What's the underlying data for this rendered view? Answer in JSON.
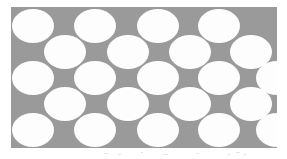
{
  "figure": {
    "name": "circle-packing-diagram",
    "canvas_width": 287,
    "canvas_height": 159,
    "background_color": "#ffffff"
  },
  "panel": {
    "label": "packing-panel",
    "x": 11,
    "y": 7,
    "width": 266,
    "height": 141,
    "fill_color": "#9a9a9a"
  },
  "circles": {
    "fill_color": "#fdfdfd",
    "count": 22,
    "radius_x": 21,
    "radius_y": 17,
    "items": [
      {
        "id": "r1c1",
        "row": 1,
        "cx": 33,
        "cy": 26
      },
      {
        "id": "r1c2",
        "row": 1,
        "cx": 95,
        "cy": 26
      },
      {
        "id": "r1c3",
        "row": 1,
        "cx": 158,
        "cy": 26
      },
      {
        "id": "r1c4",
        "row": 1,
        "cx": 219,
        "cy": 26
      },
      {
        "id": "r2c1",
        "row": 2,
        "cx": 65,
        "cy": 52
      },
      {
        "id": "r2c2",
        "row": 2,
        "cx": 128,
        "cy": 52
      },
      {
        "id": "r2c3",
        "row": 2,
        "cx": 190,
        "cy": 52
      },
      {
        "id": "r2c4",
        "row": 2,
        "cx": 251,
        "cy": 52
      },
      {
        "id": "r3c1",
        "row": 3,
        "cx": 33,
        "cy": 78
      },
      {
        "id": "r3c2",
        "row": 3,
        "cx": 95,
        "cy": 78
      },
      {
        "id": "r3c3",
        "row": 3,
        "cx": 158,
        "cy": 78
      },
      {
        "id": "r3c4",
        "row": 3,
        "cx": 219,
        "cy": 78
      },
      {
        "id": "r4c1",
        "row": 4,
        "cx": 65,
        "cy": 104
      },
      {
        "id": "r4c2",
        "row": 4,
        "cx": 128,
        "cy": 104
      },
      {
        "id": "r4c3",
        "row": 4,
        "cx": 190,
        "cy": 104
      },
      {
        "id": "r4c4",
        "row": 4,
        "cx": 251,
        "cy": 104
      },
      {
        "id": "r5c1",
        "row": 5,
        "cx": 33,
        "cy": 130
      },
      {
        "id": "r5c2",
        "row": 5,
        "cx": 95,
        "cy": 130
      },
      {
        "id": "r5c3",
        "row": 5,
        "cx": 158,
        "cy": 130
      },
      {
        "id": "r5c4",
        "row": 5,
        "cx": 219,
        "cy": 130
      },
      {
        "id": "r5c5",
        "row": 5,
        "cx": 277,
        "cy": 130
      },
      {
        "id": "r3c5",
        "row": 3,
        "cx": 277,
        "cy": 78
      }
    ]
  },
  "artifacts": {
    "label": "scan-noise",
    "y": 150,
    "height": 9,
    "specks": [
      {
        "x": 104,
        "y": 153,
        "w": 4,
        "h": 1
      },
      {
        "x": 118,
        "y": 154,
        "w": 3,
        "h": 1
      },
      {
        "x": 141,
        "y": 152,
        "w": 2,
        "h": 1
      },
      {
        "x": 163,
        "y": 154,
        "w": 5,
        "h": 1
      },
      {
        "x": 196,
        "y": 153,
        "w": 3,
        "h": 1
      },
      {
        "x": 228,
        "y": 154,
        "w": 2,
        "h": 1
      },
      {
        "x": 236,
        "y": 152,
        "w": 4,
        "h": 1
      },
      {
        "x": 244,
        "y": 154,
        "w": 2,
        "h": 1
      }
    ]
  },
  "caption": {
    "text": "",
    "y": 151
  }
}
